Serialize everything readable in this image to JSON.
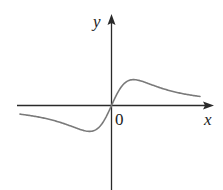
{
  "chart_data": {
    "type": "line",
    "title": "",
    "xlabel": "x",
    "ylabel": "y",
    "origin_label": "0",
    "grid": false,
    "legend": null,
    "series": [
      {
        "name": "f(x)",
        "x": [
          -4.0,
          -3.0,
          -2.0,
          -1.5,
          -1.0,
          -0.8,
          -0.5,
          -0.25,
          0.0,
          0.25,
          0.5,
          0.8,
          1.0,
          1.5,
          2.0,
          3.0,
          4.0
        ],
        "y": [
          -0.11,
          -0.17,
          -0.28,
          -0.36,
          -0.42,
          -0.43,
          -0.38,
          -0.23,
          0.0,
          0.23,
          0.38,
          0.43,
          0.42,
          0.36,
          0.28,
          0.17,
          0.11
        ]
      }
    ],
    "features": {
      "local_max": {
        "x": 0.82,
        "y": 0.43
      },
      "local_min": {
        "x": -0.82,
        "y": -0.43
      },
      "zero": {
        "x": 0,
        "y": 0
      }
    }
  },
  "labels": {
    "y_axis": "y",
    "x_axis": "x",
    "origin": "0"
  },
  "colors": {
    "axis": "#2a2a2a",
    "curve": "#7a7a7a",
    "background": "#ffffff"
  }
}
